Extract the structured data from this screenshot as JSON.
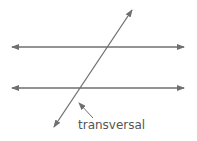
{
  "diagram": {
    "label": "transversal",
    "line_color": "#6f6f6f",
    "text_color": "#555555"
  }
}
